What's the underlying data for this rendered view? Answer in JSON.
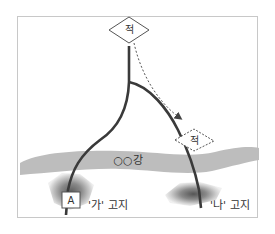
{
  "diagram": {
    "enemy_origin_label": "적",
    "enemy_destination_label": "적",
    "river_label": "○○강",
    "unit_label": "A",
    "hill_left_label": "'가' 고지",
    "hill_right_label": "'나' 고지",
    "colors": {
      "road": "#3a3a3a",
      "river": "#bdbdbd",
      "hill_dark": "#6e6e6e",
      "hill_light": "#d0d0d0",
      "frame": "#c8c8c8",
      "dotted_path": "#555555"
    },
    "elements": [
      {
        "type": "enemy-diamond",
        "style": "solid",
        "position": "top-center"
      },
      {
        "type": "enemy-diamond",
        "style": "dashed",
        "position": "right, above river"
      },
      {
        "type": "dotted-arrow",
        "from": "top enemy",
        "to": "right enemy"
      },
      {
        "type": "road",
        "shape": "Y-fork",
        "branches": [
          "left to 가 고지",
          "right to 나 고지"
        ]
      },
      {
        "type": "river",
        "name": "○○강",
        "orientation": "horizontal band"
      },
      {
        "type": "hill",
        "name": "'가' 고지",
        "position": "bottom-left"
      },
      {
        "type": "hill",
        "name": "'나' 고지",
        "position": "bottom-right"
      },
      {
        "type": "unit-box",
        "label": "A",
        "position": "at 가 고지"
      }
    ]
  }
}
